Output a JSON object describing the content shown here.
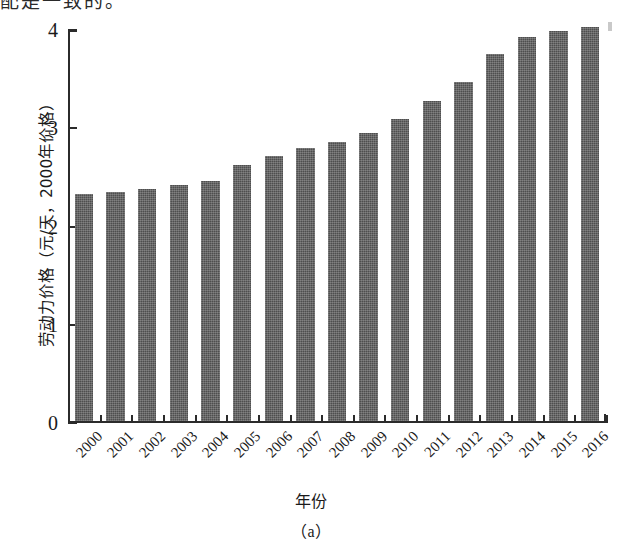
{
  "page": {
    "top_text_fragment": "配是一致的。",
    "caption": "（a）"
  },
  "chart_data": {
    "type": "bar",
    "title": "",
    "xlabel": "年份",
    "ylabel": "劳动力价格（元/天，2000年价格）",
    "categories": [
      "2000",
      "2001",
      "2002",
      "2003",
      "2004",
      "2005",
      "2006",
      "2007",
      "2008",
      "2009",
      "2010",
      "2011",
      "2012",
      "2013",
      "2014",
      "2015",
      "2016"
    ],
    "values": [
      2.31,
      2.33,
      2.36,
      2.4,
      2.44,
      2.61,
      2.7,
      2.78,
      2.84,
      2.93,
      3.07,
      3.26,
      3.45,
      3.74,
      3.91,
      3.97,
      4.01
    ],
    "ylim": [
      0,
      4
    ],
    "yticks": [
      "0",
      "1",
      "2",
      "3",
      "4"
    ],
    "ytick_values": [
      0,
      1,
      2,
      3,
      4
    ],
    "grid": false,
    "legend": "none",
    "bar_color": "#4e4e4e",
    "axis_color": "#2b2b2b"
  }
}
